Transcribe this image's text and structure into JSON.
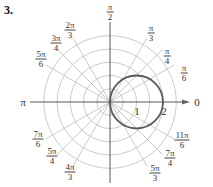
{
  "problem_number": "3.",
  "chart_data": {
    "type": "polar-line",
    "title": "",
    "equation_depicted": "r = 2cos(theta)",
    "curve": {
      "description": "circle through origin, center (1, 0), radius 1",
      "points_theta_r": [
        [
          0,
          2
        ],
        [
          0.5236,
          1.732
        ],
        [
          0.7854,
          1.414
        ],
        [
          1.0472,
          1.0
        ],
        [
          1.5708,
          0
        ],
        [
          -1.0472,
          1.0
        ],
        [
          -0.7854,
          1.414
        ],
        [
          -0.5236,
          1.732
        ]
      ],
      "color": "#5a5a5a"
    },
    "radial_rings": [
      0.5,
      1,
      1.5,
      2,
      2.5
    ],
    "radial_tick_labels": [
      "1",
      "2"
    ],
    "angle_labels": [
      {
        "id": "a0",
        "num": "0",
        "den": ""
      },
      {
        "id": "a30",
        "num": "π",
        "den": "6"
      },
      {
        "id": "a45",
        "num": "π",
        "den": "4"
      },
      {
        "id": "a60",
        "num": "π",
        "den": "3"
      },
      {
        "id": "a90",
        "num": "π",
        "den": "2"
      },
      {
        "id": "a120",
        "num": "2π",
        "den": "3"
      },
      {
        "id": "a135",
        "num": "3π",
        "den": "4"
      },
      {
        "id": "a150",
        "num": "5π",
        "den": "6"
      },
      {
        "id": "a180",
        "num": "π",
        "den": ""
      },
      {
        "id": "a210",
        "num": "7π",
        "den": "6"
      },
      {
        "id": "a225",
        "num": "5π",
        "den": "4"
      },
      {
        "id": "a240",
        "num": "4π",
        "den": "3"
      },
      {
        "id": "a300",
        "num": "5π",
        "den": "3"
      },
      {
        "id": "a315",
        "num": "7π",
        "den": "4"
      },
      {
        "id": "a330",
        "num": "11π",
        "den": "6"
      }
    ],
    "grid": true,
    "colors": {
      "grid": "#c4c4c4",
      "axes": "#444444",
      "curve": "#5a5a5a"
    }
  }
}
